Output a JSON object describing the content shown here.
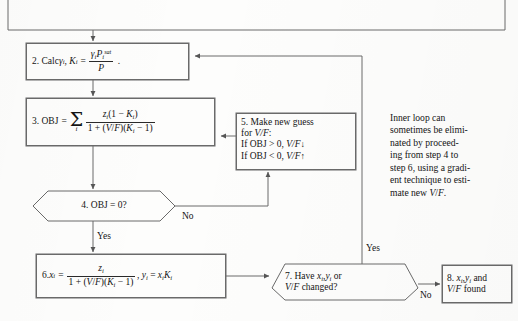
{
  "diagram": {
    "background_color": "#fdfdfc",
    "line_color": "#6a6a6a",
    "text_color": "#141414"
  },
  "nodes": {
    "top_box": {
      "id": "top-partial-box",
      "label": "",
      "shape": "rect",
      "note": "partially visible box cropped at top edge"
    },
    "step2": {
      "id": "step-2",
      "shape": "rect",
      "number": "2.",
      "text_plain": "2. Calc γi, Ki = γi Pi^sat / P .",
      "prefix": "2. Calc ",
      "var1": "γ",
      "var1_sub": "i",
      "var2": "K",
      "var2_sub": "i",
      "equals": "=",
      "num_base1": "γ",
      "num_sub1": "i",
      "num_base2": "P",
      "num_sub2": "i",
      "num_sup2": "sat",
      "den": "P",
      "trailing": "."
    },
    "step3": {
      "id": "step-3",
      "shape": "rect",
      "text_plain": "3. OBJ = Σi zi(1 − Ki) / [1 + (V/F)(Ki − 1)]",
      "prefix": "3. OBJ",
      "equals": "=",
      "sum_symbol": "Σ",
      "sum_index": "i",
      "numerator": "z i (1 − K i )",
      "denominator": "1 + (V/F)(K i − 1)"
    },
    "step4": {
      "id": "step-4",
      "shape": "hexagon",
      "text_plain": "4. OBJ = 0?"
    },
    "step5": {
      "id": "step-5",
      "shape": "rect",
      "line1": "5. Make new guess",
      "line2_prefix": "for ",
      "line2_var": "V/F",
      "line2_suffix": ":",
      "line3_prefix": "If OBJ > 0, ",
      "line3_var": "V/F",
      "line3_arrow": "↓",
      "line4_prefix": "If OBJ < 0, ",
      "line4_var": "V/F",
      "line4_arrow": "↑",
      "text_plain": "5. Make new guess for V/F: If OBJ > 0, V/F↓ If OBJ < 0, V/F↑"
    },
    "step6": {
      "id": "step-6",
      "shape": "rect",
      "text_plain": "6. xi = zi / [1 + (V/F)(Ki − 1)] , yi = xi Ki",
      "prefix": "6. ",
      "lhs_base": "x",
      "lhs_sub": "i",
      "equals": "=",
      "numerator": "z i",
      "denominator": "1 + (V/F)(K i − 1)",
      "second_eq": ", y i = x i K i"
    },
    "step7": {
      "id": "step-7",
      "shape": "hexagon",
      "line1": "7. Have xi,yi or",
      "line2": "V/F changed?",
      "text_plain": "7. Have xi, yi or V/F changed?"
    },
    "step8": {
      "id": "step-8",
      "shape": "rect",
      "line1": "8. xi,yi and",
      "line2": "V/F found",
      "text_plain": "8. xi, yi and V/F found"
    }
  },
  "edge_labels": {
    "no_from_step4": "No",
    "yes_from_step4": "Yes",
    "yes_from_step7": "Yes",
    "no_from_step7": "No"
  },
  "annotation": {
    "id": "inner-loop-note",
    "lines": [
      "Inner loop can",
      "sometimes be elimi-",
      "nated by proceed-",
      "ing from step 4 to",
      "step 6, using a gradi-",
      "ent technique to esti-",
      "mate new V/F."
    ],
    "text_plain": "Inner loop can sometimes be eliminated by proceeding from step 4 to step 6, using a gradient technique to estimate new V/F."
  }
}
